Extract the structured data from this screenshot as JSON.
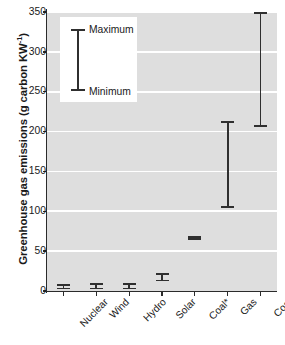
{
  "chart_data": {
    "type": "bar",
    "title": "",
    "xlabel": "",
    "ylabel": "Greenhouse gas emissions (g carbon KW",
    "ylabel_exponent": "-1",
    "ylabel_suffix": ")",
    "ylim": [
      0,
      350
    ],
    "yticks": [
      0,
      50,
      100,
      150,
      200,
      250,
      300,
      350
    ],
    "ytick_labels": [
      "0",
      "50",
      "100",
      "150",
      "200",
      "250",
      "300",
      "350"
    ],
    "grid": true,
    "grid_orientation": "horizontal",
    "grid_color": "#ffffff",
    "plot_background": "#dedede",
    "series_color": "#2f2f2f",
    "categories": [
      "Nuclear",
      "Wind",
      "Hydro",
      "Solar",
      "Coal*",
      "Gas",
      "Coal"
    ],
    "ranges": [
      {
        "category": "Nuclear",
        "minimum": 2,
        "maximum": 9
      },
      {
        "category": "Wind",
        "minimum": 2,
        "maximum": 10
      },
      {
        "category": "Hydro",
        "minimum": 2,
        "maximum": 10
      },
      {
        "category": "Solar",
        "minimum": 12,
        "maximum": 22
      },
      {
        "category": "Coal*",
        "minimum": 64,
        "maximum": 69
      },
      {
        "category": "Gas",
        "minimum": 104,
        "maximum": 213
      },
      {
        "category": "Coal",
        "minimum": 206,
        "maximum": 350
      }
    ],
    "legend": {
      "position": "upper-left",
      "maximum_label": "Maximum",
      "minimum_label": "Minimum"
    }
  }
}
